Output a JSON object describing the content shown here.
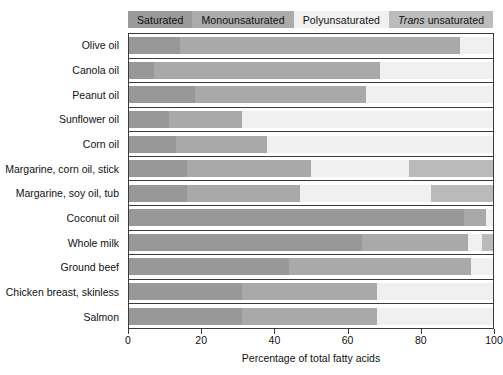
{
  "chart_data": {
    "type": "bar",
    "orientation": "horizontal",
    "stacked": true,
    "title": "",
    "xlabel": "Percentage of total fatty acids",
    "ylabel": "",
    "xlim": [
      0,
      100
    ],
    "xticks": [
      0,
      20,
      40,
      60,
      80,
      100
    ],
    "xticklabels": [
      "0",
      "20",
      "40",
      "60",
      "80",
      "100"
    ],
    "grid": false,
    "legend_position": "top",
    "legend": [
      {
        "label": "Saturated",
        "color": "#989898"
      },
      {
        "label": "Monounsaturated",
        "color": "#a9a9a9"
      },
      {
        "label": "Polyunsaturated",
        "color": "#f0f0f0"
      },
      {
        "label": "Trans unsaturated",
        "color": "#bababa",
        "italic_prefix": "Trans"
      }
    ],
    "categories": [
      "Olive oil",
      "Canola oil",
      "Peanut oil",
      "Sunflower oil",
      "Corn oil",
      "Margarine, corn oil, stick",
      "Margarine, soy oil, tub",
      "Coconut oil",
      "Whole milk",
      "Ground beef",
      "Chicken breast, skinless",
      "Salmon"
    ],
    "series": [
      {
        "name": "Saturated",
        "color": "#989898",
        "values": [
          14,
          7,
          18,
          11,
          13,
          16,
          16,
          92,
          64,
          44,
          31,
          31
        ]
      },
      {
        "name": "Monounsaturated",
        "color": "#a9a9a9",
        "values": [
          77,
          62,
          47,
          20,
          25,
          34,
          31,
          6,
          29,
          50,
          37,
          37
        ]
      },
      {
        "name": "Polyunsaturated",
        "color": "#f0f0f0",
        "values": [
          9,
          31,
          35,
          69,
          62,
          27,
          36,
          2,
          4,
          6,
          32,
          32
        ]
      },
      {
        "name": "Trans unsaturated",
        "color": "#bababa",
        "values": [
          0,
          0,
          0,
          0,
          0,
          23,
          17,
          0,
          3,
          0,
          0,
          0
        ]
      }
    ]
  },
  "axis": {
    "x_title": "Percentage of total fatty acids"
  }
}
